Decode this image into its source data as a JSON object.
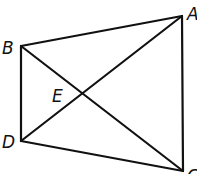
{
  "diagram": {
    "type": "quadrilateral-with-diagonals",
    "points": {
      "A": {
        "label": "A",
        "x": 182,
        "y": 16,
        "lx": 187,
        "ly": 20
      },
      "B": {
        "label": "B",
        "x": 21,
        "y": 46,
        "lx": 2,
        "ly": 54
      },
      "C": {
        "label": "C",
        "x": 183,
        "y": 171,
        "lx": 187,
        "ly": 182
      },
      "D": {
        "label": "D",
        "x": 21,
        "y": 141,
        "lx": 2,
        "ly": 148
      },
      "E": {
        "label": "E",
        "x": 81,
        "y": 95,
        "lx": 52,
        "ly": 102
      }
    },
    "segments": [
      {
        "name": "segment-AB",
        "from": "A",
        "to": "B"
      },
      {
        "name": "segment-BD",
        "from": "B",
        "to": "D"
      },
      {
        "name": "segment-DC",
        "from": "D",
        "to": "C"
      },
      {
        "name": "segment-CA",
        "from": "C",
        "to": "A"
      },
      {
        "name": "diagonal-AD",
        "from": "A",
        "to": "D"
      },
      {
        "name": "diagonal-BC",
        "from": "B",
        "to": "C"
      }
    ],
    "stroke_color": "#111111",
    "background": "#ffffff"
  }
}
